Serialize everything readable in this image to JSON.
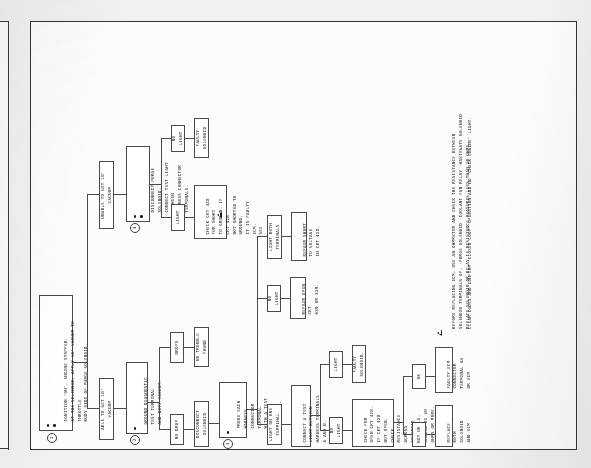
{
  "page": {
    "title": "Canister Purge Valve—3.8L",
    "document_type": "diagnostic-flowchart"
  },
  "colors": {
    "ink": "#1c1c1c",
    "rule": "#4a4a4a",
    "frame": "#353535",
    "paper": "#fcfcfb",
    "page_background": "#f2f1ef"
  },
  "steps": {
    "one": "1",
    "two": "2",
    "three": "3",
    "four": "4"
  },
  "nodes": {
    "start": "IGNITION \"ON\", ENGINE STOPPED.\nAT THE SOLENOID, APPLY 10\" VACUUM TO THROTTLE\nBODY SIDE OF PURGE SOLENOID.",
    "able_vacuum": "ABLE TO GET 10\" VACUUM",
    "unable_vacuum": "UNABLE TO GET 10\" VACUUM",
    "ground_diag": "GROUND DIAGNOSTIC TEST TERMINAL\nAND NOTE VACUUM.",
    "no_drop": "NO DROP",
    "drops": "DROPS",
    "no_trouble": "NO TROUBLE FOUND",
    "disconnect_solenoid": "DISCONNECT SOLENOID",
    "probe_harness": "PROBE EACH HARNESS\nCONNECTOR TERMINAL\nWITH A TEST LIGHT\nTO GROUND.",
    "light_one_terminal": "LIGHT ON ONE TERMINAL",
    "light_both_terminals": "LIGHT BOTH TERMINALS",
    "no_light_a": "NO LIGHT",
    "repair_short": "REPAIR SHORT TO VOLTAGE\nIN CKT 428.",
    "repair_open": "REPAIR OPEN CKT\n639 OR 339.",
    "connect_test_light_ab": "CONNECT A TEST LIGHT BETWEEN\nHARNESS TERMINALS A AND B.",
    "no_light_b": "NO LIGHT",
    "light_b": "LIGHT",
    "faulty_solenoid_b": "FAULTY SOLENOID.",
    "check_open_428": "CHECK FOR OPEN CKT 428. IF CKT 428 NOT OPEN, CHECK RESISTANCE\nACROSS SOLENOID TERMINALS. SHOULD BE 20 OHMS OR MORE.",
    "not_ok": "NOT OK",
    "ok": "OK",
    "replace_both": "REPLACE BOTH SOLENOID\nAND ECM",
    "faulty_ecm": "FAULTY ECM CONNECTOR\nTERMINAL A3 OR ECM",
    "disconnect_purge": "DISCONNECT PURGE SOLENOID.\nCONNECT TEST LIGHT BETWEEN\nHARNESS CONNECTOR TERMINALS.",
    "no_light_c": "NO LIGHT",
    "light_c": "LIGHT",
    "faulty_solenoid_c": "FAULTY SOLENOID",
    "check_short_428": "CHECK CKT 428 FOR SHORT\nTO GROUND. IF CKT 428\nNOT SHORTED TO GROUND,\nIT IS FAULTY ECM.\nSEE"
  },
  "footnote": {
    "warning": "BEFORE REPLACING ECM, USE AN OHMMETER AND CHECK THE RESISTANCE BETWEEN\nSOLENOID TERMINALS OF: -PURGE SOLENOID  -COOLANT FAN RELAY  -WASTEGATE SOLENOID\nREPLACE SOLENOID OR RELAY IF RESISTANCE MEASURES LESS THAN 20 OHMS.",
    "closing": "CLEAR CODES AND CONFIRM \"CLOSED LOOP\" OPERATION AND NO \"CHECK ENGINE\" LIGHT."
  }
}
